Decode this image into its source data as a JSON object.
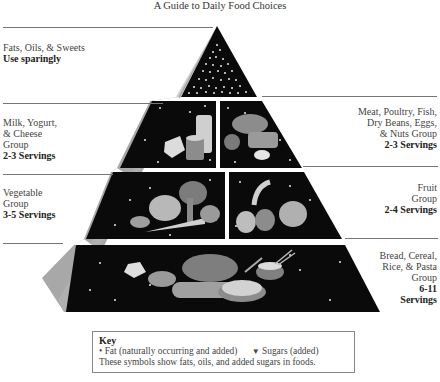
{
  "title": "A Guide to Daily Food Choices",
  "tiers": [
    {
      "id": "fats",
      "name_lines": [
        "Fats, Oils, & Sweets"
      ],
      "servings": "Use sparingly",
      "side": "left"
    },
    {
      "id": "milk",
      "name_lines": [
        "Milk, Yogurt,",
        "& Cheese",
        "Group"
      ],
      "servings": "2-3 Servings",
      "side": "left"
    },
    {
      "id": "meat",
      "name_lines": [
        "Meat, Poultry, Fish,",
        "Dry Beans, Eggs,",
        "& Nuts Group"
      ],
      "servings": "2-3 Servings",
      "side": "right"
    },
    {
      "id": "vegetable",
      "name_lines": [
        "Vegetable",
        "Group"
      ],
      "servings": "3-5 Servings",
      "side": "left"
    },
    {
      "id": "fruit",
      "name_lines": [
        "Fruit",
        "Group"
      ],
      "servings": "2-4 Servings",
      "side": "right"
    },
    {
      "id": "bread",
      "name_lines": [
        "Bread, Cereal,",
        "Rice, & Pasta",
        "Group"
      ],
      "servings_lines": [
        "6-11",
        "Servings"
      ],
      "side": "right"
    }
  ],
  "key": {
    "title": "Key",
    "fat_symbol": "•",
    "fat_label": "Fat (naturally occurring and added)",
    "sugar_symbol": "▼",
    "sugar_label": "Sugars (added)",
    "note": "These symbols show fats, oils, and added sugars in foods."
  },
  "colors": {
    "tier_fill": "#0a0a0a",
    "side_face": "#a8a8a8",
    "rule": "#777777",
    "food_light": "#cfcfcf",
    "food_mid": "#8c8c8c"
  }
}
